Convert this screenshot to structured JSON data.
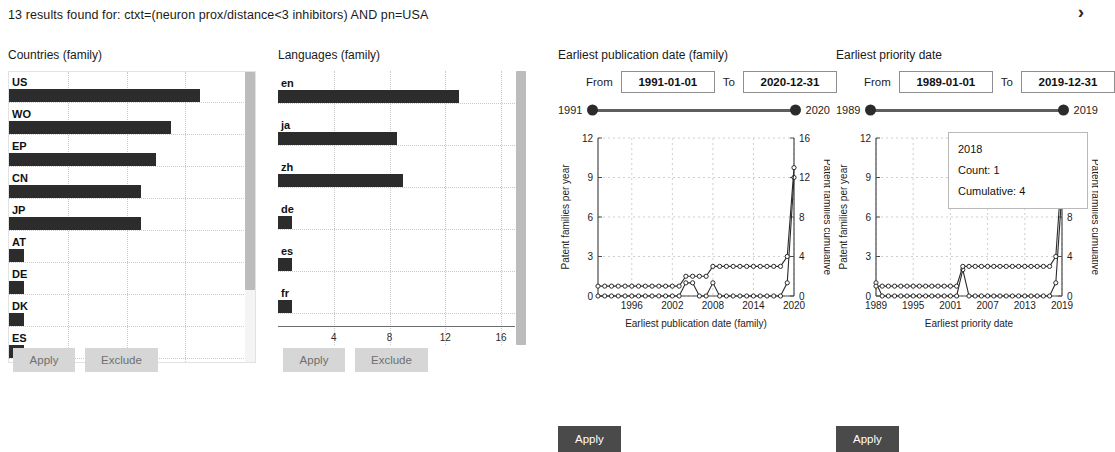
{
  "header": {
    "results_text": "13 results found for: ctxt=(neuron prox/distance<3 inhibitors) AND pn=USA",
    "expand_icon": "chevron-right-icon"
  },
  "countries_panel": {
    "title": "Countries (family)",
    "apply_label": "Apply",
    "exclude_label": "Exclude",
    "chart_data": {
      "type": "bar",
      "orientation": "horizontal",
      "title": "Countries (family)",
      "xlabel": "",
      "ylabel": "",
      "categories": [
        "US",
        "WO",
        "EP",
        "CN",
        "JP",
        "AT",
        "DE",
        "DK",
        "ES"
      ],
      "values": [
        13,
        11,
        10,
        9,
        9,
        1,
        1,
        1,
        1
      ],
      "xlim": [
        0,
        16
      ],
      "grid": true,
      "scrollable": true
    }
  },
  "languages_panel": {
    "title": "Languages (family)",
    "apply_label": "Apply",
    "exclude_label": "Exclude",
    "chart_data": {
      "type": "bar",
      "orientation": "horizontal",
      "title": "Languages (family)",
      "xlabel": "",
      "ylabel": "",
      "categories": [
        "en",
        "ja",
        "zh",
        "de",
        "es",
        "fr"
      ],
      "values": [
        13,
        8.5,
        9,
        1,
        1,
        1
      ],
      "xticks": [
        4,
        8,
        12,
        16
      ],
      "xlim": [
        0,
        17
      ],
      "grid": true,
      "scrollable": true
    }
  },
  "publication_panel": {
    "title": "Earliest publication date (family)",
    "from_label": "From",
    "to_label": "To",
    "from_value": "1991-01-01",
    "to_value": "2020-12-31",
    "slider_min": "1991",
    "slider_max": "2020",
    "apply_label": "Apply",
    "chart_data": {
      "type": "line",
      "title": "",
      "xlabel": "Earliest publication date (family)",
      "ylabel": "Patent families per year",
      "y2label": "Patent families cumulative",
      "xlim": [
        1991,
        2020
      ],
      "ylim": [
        0,
        12
      ],
      "y2lim": [
        0,
        16
      ],
      "yticks": [
        0,
        3,
        6,
        9,
        12
      ],
      "y2ticks": [
        0,
        4,
        8,
        12,
        16
      ],
      "xticks": [
        1996,
        2002,
        2008,
        2014,
        2020
      ],
      "grid": true,
      "series": [
        {
          "name": "Patent families per year",
          "axis": "left",
          "x": [
            1991,
            1992,
            1993,
            1994,
            1995,
            1996,
            1997,
            1998,
            1999,
            2000,
            2001,
            2002,
            2003,
            2004,
            2005,
            2006,
            2007,
            2008,
            2009,
            2010,
            2011,
            2012,
            2013,
            2014,
            2015,
            2016,
            2017,
            2018,
            2019,
            2020
          ],
          "values": [
            0,
            0,
            0,
            0,
            0,
            0,
            0,
            0,
            0,
            0,
            0,
            0,
            0,
            1,
            1,
            0,
            0,
            1,
            0,
            0,
            0,
            0,
            0,
            0,
            0,
            0,
            0,
            0,
            1,
            9
          ]
        },
        {
          "name": "Patent families cumulative",
          "axis": "right",
          "x": [
            1991,
            1992,
            1993,
            1994,
            1995,
            1996,
            1997,
            1998,
            1999,
            2000,
            2001,
            2002,
            2003,
            2004,
            2005,
            2006,
            2007,
            2008,
            2009,
            2010,
            2011,
            2012,
            2013,
            2014,
            2015,
            2016,
            2017,
            2018,
            2019,
            2020
          ],
          "values": [
            1,
            1,
            1,
            1,
            1,
            1,
            1,
            1,
            1,
            1,
            1,
            1,
            1,
            2,
            2,
            2,
            2,
            3,
            3,
            3,
            3,
            3,
            3,
            3,
            3,
            3,
            3,
            3,
            4,
            13
          ]
        }
      ]
    }
  },
  "priority_panel": {
    "title": "Earliest priority date",
    "from_label": "From",
    "to_label": "To",
    "from_value": "1989-01-01",
    "to_value": "2019-12-31",
    "slider_min": "1989",
    "slider_max": "2019",
    "apply_label": "Apply",
    "tooltip": {
      "year": "2018",
      "count": "Count: 1",
      "cumulative": "Cumulative: 4"
    },
    "chart_data": {
      "type": "line",
      "title": "",
      "xlabel": "Earliest priority date",
      "ylabel": "Patent families per year",
      "y2label": "Patent families cumulative",
      "xlim": [
        1989,
        2019
      ],
      "ylim": [
        0,
        12
      ],
      "y2lim": [
        0,
        16
      ],
      "yticks": [
        0,
        3,
        6,
        9,
        12
      ],
      "y2ticks": [
        0,
        4,
        8,
        12,
        16
      ],
      "xticks": [
        1989,
        1995,
        2001,
        2007,
        2013,
        2019
      ],
      "grid": true,
      "series": [
        {
          "name": "Patent families per year",
          "axis": "left",
          "x": [
            1989,
            1990,
            1991,
            1992,
            1993,
            1994,
            1995,
            1996,
            1997,
            1998,
            1999,
            2000,
            2001,
            2002,
            2003,
            2004,
            2005,
            2006,
            2007,
            2008,
            2009,
            2010,
            2011,
            2012,
            2013,
            2014,
            2015,
            2016,
            2017,
            2018,
            2019
          ],
          "values": [
            1,
            0,
            0,
            0,
            0,
            0,
            0,
            0,
            0,
            0,
            0,
            0,
            0,
            0,
            2,
            0,
            0,
            0,
            0,
            0,
            0,
            0,
            0,
            0,
            0,
            0,
            0,
            0,
            0,
            1,
            8
          ]
        },
        {
          "name": "Patent families cumulative",
          "axis": "right",
          "x": [
            1989,
            1990,
            1991,
            1992,
            1993,
            1994,
            1995,
            1996,
            1997,
            1998,
            1999,
            2000,
            2001,
            2002,
            2003,
            2004,
            2005,
            2006,
            2007,
            2008,
            2009,
            2010,
            2011,
            2012,
            2013,
            2014,
            2015,
            2016,
            2017,
            2018,
            2019
          ],
          "values": [
            1,
            1,
            1,
            1,
            1,
            1,
            1,
            1,
            1,
            1,
            1,
            1,
            1,
            1,
            3,
            3,
            3,
            3,
            3,
            3,
            3,
            3,
            3,
            3,
            3,
            3,
            3,
            3,
            3,
            4,
            13
          ]
        }
      ]
    }
  }
}
